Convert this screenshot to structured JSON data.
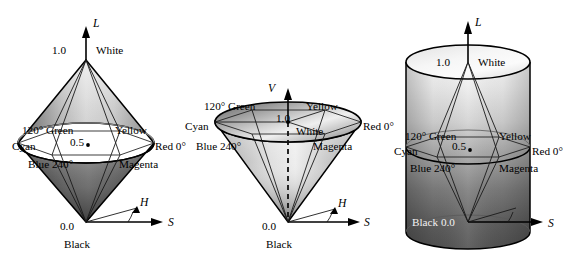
{
  "figure": {
    "background": "#ffffff"
  },
  "colors": {
    "outline": "#000000",
    "white_top": "#f2f2f2",
    "black_bottom": "#4a4a4a",
    "mid_gray": "#9a9a9a",
    "label_dark": "#000000",
    "label_light": "#f2f2f2"
  },
  "diagrams": [
    {
      "id": "hls-double-cone",
      "shape": "double-cone",
      "axis_label": "L",
      "saturation_axis_label": "S",
      "hue_axis_label": "H",
      "top_value": "1.0",
      "top_name": "White",
      "mid_value": "0.5",
      "bottom_value": "0.0",
      "bottom_name": "Black",
      "hues": {
        "green": "120° Green",
        "yellow": "Yellow",
        "cyan": "Cyan",
        "red": "Red 0°",
        "blue": "Blue 240°",
        "magenta": "Magenta"
      }
    },
    {
      "id": "hsv-cone",
      "shape": "cone",
      "axis_label": "V",
      "saturation_axis_label": "S",
      "hue_axis_label": "H",
      "top_value": "1.0",
      "top_name": "White",
      "mid_value": "",
      "bottom_value": "0.0",
      "bottom_name": "Black",
      "hues": {
        "green": "120° Green",
        "yellow": "Yellow",
        "cyan": "Cyan",
        "red": "Red 0°",
        "blue": "Blue 240°",
        "magenta": "Magenta"
      }
    },
    {
      "id": "hsl-cylinder",
      "shape": "cylinder",
      "axis_label": "L",
      "saturation_axis_label": "S",
      "hue_axis_label": "",
      "top_value": "1.0",
      "top_name": "White",
      "mid_value": "0.5",
      "bottom_value": "Black 0.0",
      "bottom_name": "",
      "hues": {
        "green": "120° Green",
        "yellow": "Yellow",
        "cyan": "Cyan",
        "red": "Red 0°",
        "blue": "Blue 240°",
        "magenta": "Magenta"
      }
    }
  ]
}
